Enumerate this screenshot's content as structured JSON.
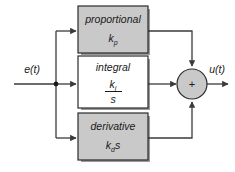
{
  "diagram": {
    "type": "block-diagram",
    "background_color": "#ffffff",
    "line_color": "#3a3a3a",
    "block_fill_gray": "#c9c9c9",
    "block_fill_white": "#ffffff",
    "block_border_color": "#2b2b2b",
    "shadow_color": "#9a9a9a",
    "input": {
      "label": "e(t)",
      "node_name": "input-signal-label"
    },
    "output": {
      "label": "u(t)",
      "node_name": "output-signal-label"
    },
    "summing_junction": {
      "symbol": "+",
      "fill": "#c9c9c9",
      "inputs": 3
    },
    "blocks": [
      {
        "id": "proportional",
        "title": "proportional",
        "gain_main": "k",
        "gain_sub": "p",
        "gain_suffix": "",
        "is_fraction": false,
        "fill": "#c9c9c9"
      },
      {
        "id": "integral",
        "title": "integral",
        "gain_main": "k",
        "gain_sub": "i",
        "gain_suffix": "",
        "denominator": "s",
        "is_fraction": true,
        "fill": "#ffffff"
      },
      {
        "id": "derivative",
        "title": "derivative",
        "gain_main": "k",
        "gain_sub": "d",
        "gain_suffix": "s",
        "is_fraction": false,
        "fill": "#c9c9c9"
      }
    ]
  }
}
